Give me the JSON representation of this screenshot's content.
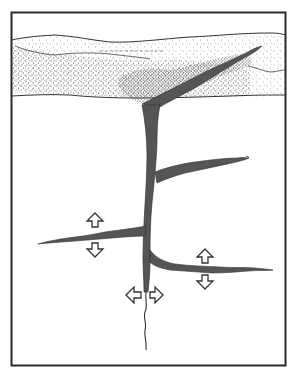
{
  "figure": {
    "description": "Cross-section illustration of a vertical fracture/dike rising from below into an upper stippled sediment layer, with horizontal side branches; hollow arrows indicate opening directions",
    "colors": {
      "background": "#ffffff",
      "frame": "#2a2a2a",
      "fill": "#555555",
      "outline": "#333333",
      "stipple": "#3a3a3a"
    },
    "frame": {
      "x": 11,
      "y": 12,
      "width": 275,
      "height": 354
    },
    "layers": [
      {
        "name": "upper-stippled-layer",
        "y_top": 38,
        "y_bottom": 97
      }
    ],
    "branches": [
      {
        "name": "diagonal-branch-upper-right"
      },
      {
        "name": "right-branch-upper"
      },
      {
        "name": "left-branch"
      },
      {
        "name": "right-branch-lower"
      },
      {
        "name": "main-trunk-vertical"
      },
      {
        "name": "root-tail"
      }
    ],
    "arrows": [
      {
        "name": "left-branch-up-arrow",
        "direction": "up"
      },
      {
        "name": "left-branch-down-arrow",
        "direction": "down"
      },
      {
        "name": "right-branch-up-arrow",
        "direction": "up"
      },
      {
        "name": "right-branch-down-arrow",
        "direction": "down"
      },
      {
        "name": "trunk-left-arrow",
        "direction": "left"
      },
      {
        "name": "trunk-right-arrow",
        "direction": "right"
      }
    ]
  }
}
